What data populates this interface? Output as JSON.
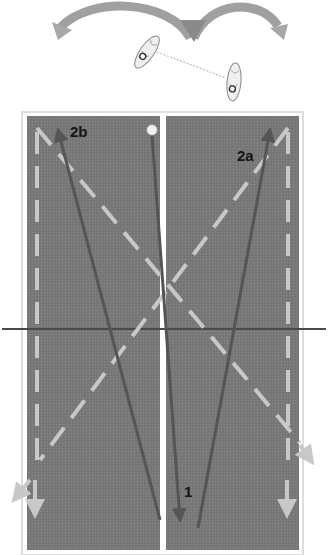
{
  "diagram": {
    "type": "court-movement-drill",
    "labels": {
      "path_1": "1",
      "path_2a": "2a",
      "path_2b": "2b"
    },
    "top_graphic": {
      "arrows": [
        "swing-left-arrow",
        "swing-right-arrow"
      ],
      "players": [
        "shoe-left",
        "shoe-right"
      ],
      "connector": "dotted-line"
    },
    "colors": {
      "court": "#7a7a7a",
      "court_border": "#d8d8d8",
      "center_line": "#ffffff",
      "net_line": "#4a4a4a",
      "solid_path": "#555555",
      "dashed_path": "#c8c8c8",
      "top_arrow": "#9a9a9a",
      "ball": "#f2f2f2",
      "label": "#151515"
    }
  }
}
